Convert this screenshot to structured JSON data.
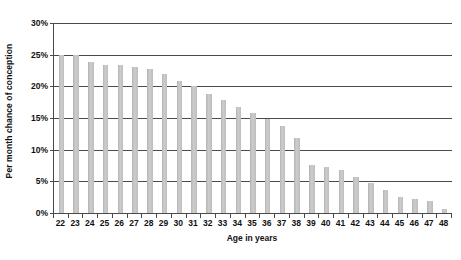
{
  "chart_data": {
    "type": "bar",
    "title": "",
    "xlabel": "Age in years",
    "ylabel": "Per month chance of conception",
    "categories": [
      "22",
      "23",
      "24",
      "25",
      "26",
      "27",
      "28",
      "29",
      "30",
      "31",
      "32",
      "33",
      "34",
      "35",
      "36",
      "37",
      "38",
      "39",
      "40",
      "41",
      "42",
      "43",
      "44",
      "45",
      "46",
      "47",
      "48"
    ],
    "values": [
      25.0,
      25.0,
      23.8,
      23.4,
      23.4,
      23.1,
      22.8,
      21.9,
      20.8,
      20.0,
      18.8,
      17.9,
      16.7,
      15.8,
      14.9,
      13.8,
      11.9,
      7.6,
      7.3,
      6.8,
      5.7,
      4.8,
      3.7,
      2.6,
      2.2,
      1.9,
      0.6
    ],
    "ylim": [
      0,
      30
    ],
    "ytick_values": [
      0,
      5,
      10,
      15,
      20,
      25,
      30
    ],
    "ytick_labels": [
      "0%",
      "5%",
      "10%",
      "15%",
      "20%",
      "25%",
      "30%"
    ],
    "grid": true,
    "legend": "none",
    "series_color": "#c2c2c2",
    "axis_color": "#4a4a4a",
    "background_color": "#ffffff",
    "value_suffix": "%"
  }
}
